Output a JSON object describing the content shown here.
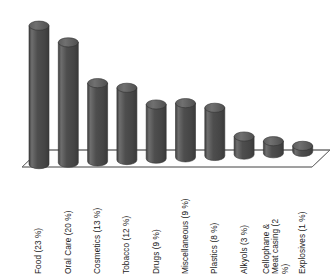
{
  "chart_data": {
    "type": "bar",
    "title": "",
    "subtitle": "",
    "xlabel": "",
    "ylabel": "",
    "grid": false,
    "legend": "none",
    "style": "3d-cylinder",
    "ylim": [
      0,
      25
    ],
    "categories": [
      "Food (23 %)",
      "Oral Care (20 %)",
      "Cosmetics (13 %)",
      "Tobacco (12 %)",
      "Drugs (9 %)",
      "Miscellaneous (9 %)",
      "Plastics (8 %)",
      "Alkyols (3 %)",
      "Cellophane & Meat casing (2 %)",
      "Explosives (1 %)"
    ],
    "values": [
      23,
      20,
      13,
      12,
      9,
      9,
      8,
      3,
      2,
      1
    ],
    "units": "%",
    "colors": {
      "bar_body": "#4c4c4c",
      "bar_body_light": "#6b6b6b",
      "bar_top": "#5a5a5a",
      "bar_outline": "#2e2e2e",
      "floor": "#fdfdfd",
      "floor_line": "#5a5a5a",
      "text": "#1a1a1a"
    }
  },
  "axis": {
    "baseline_name": "category-axis"
  }
}
